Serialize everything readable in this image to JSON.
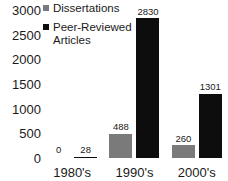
{
  "chart_data": {
    "type": "bar",
    "title": "",
    "subtitle": "",
    "xlabel": "",
    "ylabel": "",
    "categories": [
      "1980's",
      "1990's",
      "2000's"
    ],
    "series": [
      {
        "name": "Dissertations",
        "color": "#7a7a7a",
        "values": [
          0,
          488,
          260
        ],
        "labels": [
          "0",
          "488",
          "260"
        ]
      },
      {
        "name": "Peer-Reviewed\nArticles",
        "color": "#0d0d0d",
        "values": [
          28,
          2830,
          1301
        ],
        "labels": [
          "28",
          "2830",
          "1301"
        ]
      }
    ],
    "ylim": [
      0,
      3000
    ],
    "yticks": [
      3000,
      2500,
      2000,
      1500,
      1000,
      500,
      0
    ],
    "ytick_labels": [
      "3000",
      "2500",
      "2000",
      "1500",
      "1000",
      "500",
      "0"
    ],
    "grid": false,
    "legend_position": "top-left",
    "data_labels": true
  },
  "legend": {
    "entries": [
      {
        "label": "Dissertations",
        "color": "#7a7a7a"
      },
      {
        "label": "Peer-Reviewed\nArticles",
        "color": "#0d0d0d"
      }
    ]
  }
}
